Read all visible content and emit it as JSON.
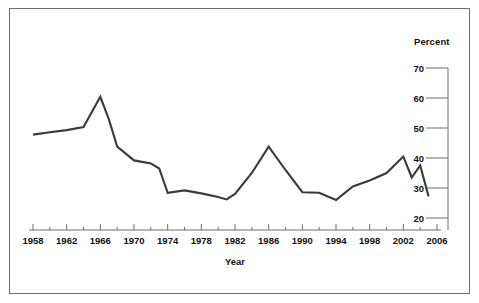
{
  "figure": {
    "border_color": "#6e6e6e",
    "background": "#ffffff",
    "line_color": "#3a3a3a"
  },
  "labels": {
    "percent_unit": "Percent",
    "x_axis_title": "Year"
  },
  "chart_data": {
    "type": "line",
    "title": "",
    "xlabel": "Year",
    "ylabel": "Percent",
    "ylim": [
      20,
      70
    ],
    "xlim": [
      1958,
      2006
    ],
    "grid": false,
    "legend": "none",
    "y_ticks": [
      20,
      30,
      40,
      50,
      60,
      70
    ],
    "y_tick_labels": [
      "20",
      "30",
      "40",
      "50",
      "60",
      "70"
    ],
    "y_axis_position": "right",
    "x_ticks": [
      1958,
      1962,
      1966,
      1970,
      1974,
      1978,
      1982,
      1986,
      1990,
      1994,
      1998,
      2002,
      2006
    ],
    "x_tick_labels": [
      "1958",
      "1962",
      "1966",
      "1970",
      "1974",
      "1978",
      "1982",
      "1986",
      "1990",
      "1994",
      "1998",
      "2002",
      "2006"
    ],
    "x_minor_tick_interval": 2,
    "series": [
      {
        "name": "Percent",
        "x": [
          1958,
          1960,
          1962,
          1964,
          1966,
          1967,
          1968,
          1970,
          1972,
          1973,
          1974,
          1976,
          1978,
          1980,
          1981,
          1982,
          1984,
          1986,
          1988,
          1990,
          1992,
          1994,
          1996,
          1998,
          2000,
          2002,
          2003,
          2004,
          2005
        ],
        "values": [
          47.8,
          48.6,
          49.3,
          50.3,
          60.4,
          53.0,
          43.8,
          39.2,
          38.2,
          36.5,
          28.4,
          29.2,
          28.2,
          27.0,
          26.2,
          28.0,
          35.0,
          43.8,
          36.0,
          28.6,
          28.4,
          26.0,
          30.5,
          32.5,
          35.0,
          40.5,
          33.5,
          37.5,
          27.2
        ]
      }
    ]
  }
}
